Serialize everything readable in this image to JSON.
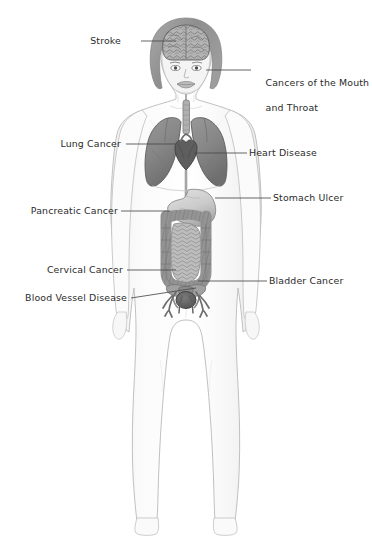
{
  "diagram": {
    "background_color": "#ffffff",
    "text_color": "#2b2b2b",
    "leader_line_color": "#4a4a4a",
    "organ_colors": {
      "skin": "#fafafa",
      "skin_outline": "#b9b9b9",
      "hair": "#9a9a9a",
      "brain": "#b0b0b0",
      "lung": "#868686",
      "heart": "#5e5e5e",
      "stomach": "#cfcfcf",
      "large_intestine": "#8e8e8e",
      "small_intestine": "#b5b5b5",
      "bladder": "#5a5a5a",
      "blood_vessel": "#6d6d6d",
      "pelvis": "#9c9c9c",
      "trachea": "#a8a8a8"
    },
    "callouts": [
      {
        "id": "stroke",
        "label": "Stroke",
        "side": "left",
        "lines": [
          "Stroke"
        ]
      },
      {
        "id": "mouth-throat",
        "label": "Cancers of the Mouth and Throat",
        "side": "right",
        "lines": [
          "Cancers of the Mouth",
          "and Throat"
        ]
      },
      {
        "id": "lung-cancer",
        "label": "Lung Cancer",
        "side": "left",
        "lines": [
          "Lung Cancer"
        ]
      },
      {
        "id": "heart-disease",
        "label": "Heart Disease",
        "side": "right",
        "lines": [
          "Heart Disease"
        ]
      },
      {
        "id": "stomach-ulcer",
        "label": "Stomach Ulcer",
        "side": "right",
        "lines": [
          "Stomach Ulcer"
        ]
      },
      {
        "id": "pancreatic",
        "label": "Pancreatic Cancer",
        "side": "left",
        "lines": [
          "Pancreatic Cancer"
        ]
      },
      {
        "id": "cervical",
        "label": "Cervical Cancer",
        "side": "left",
        "lines": [
          "Cervical Cancer"
        ]
      },
      {
        "id": "bladder-cancer",
        "label": "Bladder Cancer",
        "side": "right",
        "lines": [
          "Bladder Cancer"
        ]
      },
      {
        "id": "blood-vessel",
        "label": "Blood Vessel Disease",
        "side": "left",
        "lines": [
          "Blood Vessel Disease"
        ]
      }
    ],
    "labels": {
      "stroke": "Stroke",
      "mouth_throat_line1": "Cancers of the Mouth",
      "mouth_throat_line2": "and Throat",
      "lung_cancer": "Lung Cancer",
      "heart_disease": "Heart Disease",
      "stomach_ulcer": "Stomach Ulcer",
      "pancreatic_cancer": "Pancreatic Cancer",
      "cervical_cancer": "Cervical Cancer",
      "bladder_cancer": "Bladder Cancer",
      "blood_vessel_disease": "Blood Vessel Disease"
    }
  }
}
